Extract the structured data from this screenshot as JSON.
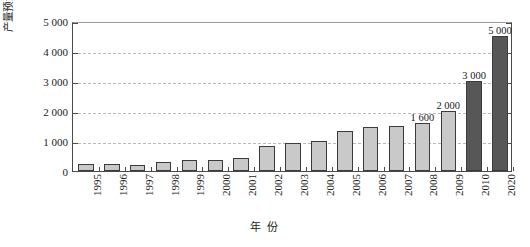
{
  "chart_data": {
    "type": "bar",
    "title": "",
    "xlabel": "年 份",
    "ylabel": "产量预测 / 万米³",
    "ylim": [
      0,
      5000
    ],
    "yticks": [
      "0",
      "1 000",
      "2 000",
      "3 000",
      "4 000",
      "5 000"
    ],
    "ytick_values": [
      0,
      1000,
      2000,
      3000,
      4000,
      5000
    ],
    "grid": true,
    "legend": "none",
    "categories": [
      "1995",
      "1996",
      "1997",
      "1998",
      "1999",
      "2000",
      "2001",
      "2002",
      "2003",
      "2004",
      "2005",
      "2006",
      "2007",
      "2008",
      "2009",
      "2010",
      "2020"
    ],
    "values": [
      230,
      225,
      210,
      290,
      360,
      380,
      440,
      850,
      950,
      1000,
      1330,
      1480,
      1490,
      1600,
      2000,
      3000,
      4500
    ],
    "bar_labels": [
      "",
      "",
      "",
      "",
      "",
      "",
      "",
      "",
      "",
      "",
      "",
      "",
      "",
      "1 600",
      "2 000",
      "3 000",
      "5 000"
    ],
    "bar_styles": [
      "light",
      "light",
      "light",
      "light",
      "light",
      "light",
      "light",
      "light",
      "light",
      "light",
      "light",
      "light",
      "light",
      "light",
      "light",
      "dark",
      "dark"
    ],
    "colors": {
      "light_bar": "#c9c9c9",
      "dark_bar": "#575757",
      "bar_edge": "#3b3b3b",
      "gridline": "#b9b9b9",
      "axis": "#4a4a4a",
      "background": "#ffffff",
      "text": "#1a1a1a"
    }
  }
}
